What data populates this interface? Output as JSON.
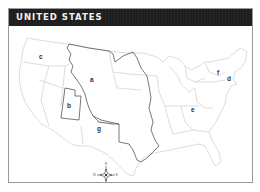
{
  "header": {
    "title": "UNITED STATES"
  },
  "colors": {
    "header_bg": "#1e1e1e",
    "header_text": "#f2f2f2",
    "state_borders": "#cfcfcf",
    "highlight_borders": "#555555",
    "frame_border": "#9a9a9a"
  },
  "map": {
    "labels": [
      {
        "id": "a",
        "text": "a",
        "region": "Louisiana Purchase"
      },
      {
        "id": "b",
        "text": "b",
        "region": "Utah"
      },
      {
        "id": "c",
        "text": "c",
        "region": "Pacific Northwest"
      },
      {
        "id": "d",
        "text": "d",
        "region": "Massachusetts"
      },
      {
        "id": "e",
        "text": "e",
        "region": "Southeast"
      },
      {
        "id": "f",
        "text": "f",
        "region": "New York"
      },
      {
        "id": "g",
        "text": "g",
        "region": "New Mexico"
      }
    ],
    "compass": {
      "n": "N",
      "s": "S",
      "e": "E",
      "w": "W"
    }
  }
}
